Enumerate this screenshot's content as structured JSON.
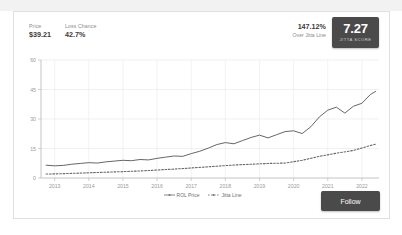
{
  "header": {
    "stats": [
      {
        "label": "Price",
        "value": "$39.21"
      },
      {
        "label": "Loss Chance",
        "value": "42.7%"
      }
    ],
    "overline_pct": "147.12%",
    "overline_text": "Over Jitta Line",
    "score_value": "7.27",
    "score_caption": "JITTA SCORE",
    "score_color": "#4a4a4a"
  },
  "actions": {
    "follow_label": "Follow",
    "follow_color": "#4a4a4a"
  },
  "chart_data": {
    "type": "line",
    "title": "",
    "xlabel": "",
    "ylabel": "",
    "ylim": [
      0,
      60
    ],
    "yticks": [
      0,
      15,
      30,
      45,
      60
    ],
    "xticks": [
      "2013",
      "2014",
      "2015",
      "2016",
      "2017",
      "2018",
      "2019",
      "2020",
      "2021",
      "2022"
    ],
    "xlim": [
      2012.6,
      2022.5
    ],
    "grid": true,
    "legend_position": "bottom-center",
    "series": [
      {
        "name": "ROL Price",
        "style": "solid",
        "color": "#555555",
        "marker": "line",
        "x": [
          2012.75,
          2013.0,
          2013.25,
          2013.5,
          2013.75,
          2014.0,
          2014.25,
          2014.5,
          2014.75,
          2015.0,
          2015.25,
          2015.5,
          2015.75,
          2016.0,
          2016.25,
          2016.5,
          2016.75,
          2017.0,
          2017.25,
          2017.5,
          2017.75,
          2018.0,
          2018.25,
          2018.5,
          2018.75,
          2019.0,
          2019.25,
          2019.5,
          2019.75,
          2020.0,
          2020.25,
          2020.5,
          2020.75,
          2021.0,
          2021.25,
          2021.5,
          2021.75,
          2022.0,
          2022.25,
          2022.4
        ],
        "values": [
          6.5,
          6.2,
          6.4,
          7.0,
          7.4,
          7.8,
          7.6,
          8.2,
          8.6,
          9.0,
          8.8,
          9.4,
          9.2,
          10.0,
          10.6,
          11.2,
          11.0,
          12.4,
          13.6,
          15.2,
          17.0,
          18.0,
          17.4,
          19.0,
          20.6,
          21.8,
          20.4,
          22.0,
          23.6,
          24.0,
          22.6,
          26.0,
          31.0,
          34.5,
          36.0,
          33.0,
          36.5,
          38.0,
          42.5,
          44.0
        ]
      },
      {
        "name": "Jitta Line",
        "style": "dotted",
        "color": "#6a6a6a",
        "marker": "dotted",
        "x": [
          2012.75,
          2013.25,
          2013.75,
          2014.25,
          2014.75,
          2015.25,
          2015.75,
          2016.25,
          2016.75,
          2017.25,
          2017.75,
          2018.25,
          2018.75,
          2019.25,
          2019.75,
          2020.25,
          2020.75,
          2021.25,
          2021.75,
          2022.25,
          2022.4
        ],
        "values": [
          2.0,
          2.2,
          2.5,
          2.8,
          3.1,
          3.4,
          3.8,
          4.3,
          4.8,
          5.4,
          6.0,
          6.6,
          7.0,
          7.4,
          7.6,
          9.0,
          11.0,
          12.6,
          14.0,
          16.5,
          17.2
        ]
      }
    ]
  }
}
